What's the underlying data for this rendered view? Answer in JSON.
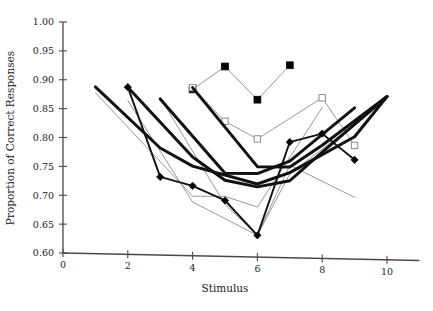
{
  "chart_data": {
    "type": "line",
    "title": "",
    "xlabel": "Stimulus",
    "ylabel": "Proportion of Correct Responses",
    "xlim": [
      0,
      11
    ],
    "ylim": [
      0.6,
      1.0
    ],
    "xticks": [
      0,
      2,
      4,
      6,
      8,
      10
    ],
    "xtick_labels": [
      "0",
      "2",
      "4",
      "6",
      "8",
      "10"
    ],
    "yticks": [
      0.6,
      0.65,
      0.7,
      0.75,
      0.8,
      0.85,
      0.9,
      0.95,
      1.0
    ],
    "ytick_labels": [
      "0.60",
      "0.65",
      "0.70",
      "0.75",
      "0.80",
      "0.85",
      "0.90",
      "0.95",
      "1.00"
    ],
    "grid": false,
    "legend": "none",
    "series": [
      {
        "name": "thick-curve-start-1",
        "style": "thick-black",
        "marker": "none",
        "x": [
          1,
          3,
          4,
          6,
          7,
          9,
          10
        ],
        "values": [
          0.888,
          0.783,
          0.752,
          0.722,
          0.742,
          0.805,
          0.875
        ]
      },
      {
        "name": "thick-curve-start-2",
        "style": "thick-black",
        "marker": "none",
        "x": [
          2,
          4,
          5,
          6,
          7,
          8,
          10
        ],
        "values": [
          0.888,
          0.768,
          0.728,
          0.717,
          0.728,
          0.778,
          0.875
        ]
      },
      {
        "name": "thick-curve-start-4",
        "style": "thick-black",
        "marker": "none",
        "x": [
          4,
          6,
          7,
          8,
          10
        ],
        "values": [
          0.888,
          0.752,
          0.752,
          0.79,
          0.875
        ]
      },
      {
        "name": "thick-curve-mid",
        "style": "thick-black",
        "marker": "none",
        "x": [
          3,
          5,
          6,
          7,
          9
        ],
        "values": [
          0.868,
          0.74,
          0.74,
          0.762,
          0.855
        ]
      },
      {
        "name": "filled-diamond-series",
        "style": "medium-black",
        "marker": "filled-diamond",
        "x": [
          2,
          3,
          4,
          5,
          6,
          7,
          8,
          9
        ],
        "values": [
          0.888,
          0.733,
          0.718,
          0.693,
          0.633,
          0.795,
          0.81,
          0.765
        ]
      },
      {
        "name": "filled-square-series",
        "style": "thin-gray",
        "marker": "filled-square",
        "x": [
          4,
          5,
          6,
          7
        ],
        "values": [
          0.885,
          0.925,
          0.868,
          0.928
        ]
      },
      {
        "name": "open-square-series",
        "style": "thin-gray",
        "marker": "open-square",
        "x": [
          4,
          5,
          6,
          8,
          9
        ],
        "values": [
          0.888,
          0.83,
          0.8,
          0.872,
          0.79
        ]
      },
      {
        "name": "thin-gray-v-left",
        "style": "thin-gray",
        "marker": "none",
        "x": [
          1,
          4,
          5,
          6,
          8
        ],
        "values": [
          0.878,
          0.7,
          0.7,
          0.682,
          0.855
        ]
      },
      {
        "name": "thin-gray-v-right",
        "style": "thin-gray",
        "marker": "none",
        "x": [
          3,
          5,
          6,
          7,
          10
        ],
        "values": [
          0.87,
          0.686,
          0.633,
          0.74,
          0.87
        ]
      },
      {
        "name": "thin-gray-v-deep",
        "style": "thin-gray",
        "marker": "none",
        "x": [
          2,
          4,
          6,
          7,
          9
        ],
        "values": [
          0.865,
          0.69,
          0.633,
          0.755,
          0.7
        ]
      }
    ]
  }
}
